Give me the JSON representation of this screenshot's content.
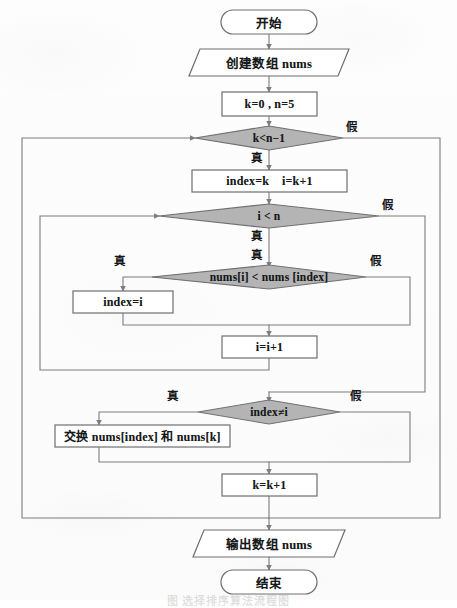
{
  "diagram": {
    "title": "选择排序算法流程图",
    "caption": "图   选择排序算法流程图",
    "colors": {
      "line": "#7c7c80",
      "decision_fill": "#b4b4b4",
      "decision_stroke": "#707074",
      "shape_stroke": "#6e6e72",
      "shape_fill": "#ffffff",
      "text": "#16181a",
      "page_background": "#fdfdfd"
    },
    "nodes": [
      {
        "id": "start",
        "type": "terminator",
        "label": "开始"
      },
      {
        "id": "create",
        "type": "io",
        "label": "创建数组 nums"
      },
      {
        "id": "init",
        "type": "process",
        "label": "k=0 , n=5"
      },
      {
        "id": "cond_k",
        "type": "decision",
        "label": "k<n−1"
      },
      {
        "id": "assign",
        "type": "process",
        "label": "index=k    i=k+1"
      },
      {
        "id": "cond_i",
        "type": "decision",
        "label": "i < n"
      },
      {
        "id": "cmp",
        "type": "decision",
        "label": "nums[i] < nums [index]"
      },
      {
        "id": "setidx",
        "type": "process",
        "label": "index=i"
      },
      {
        "id": "incr_i",
        "type": "process",
        "label": "i=i+1"
      },
      {
        "id": "cond_ne",
        "type": "decision",
        "label": "index≠i"
      },
      {
        "id": "swap",
        "type": "process",
        "label": "交换 nums[index] 和 nums[k]"
      },
      {
        "id": "incr_k",
        "type": "process",
        "label": "k=k+1"
      },
      {
        "id": "output",
        "type": "io",
        "label": "输出数组 nums"
      },
      {
        "id": "end",
        "type": "terminator",
        "label": "结束"
      }
    ],
    "branch_labels": {
      "cond_k_true": "真",
      "cond_k_false": "假",
      "cond_i_true": "真",
      "cond_i_false": "假",
      "cmp_true": "真",
      "cmp_false": "假",
      "cmp_center": "真",
      "cond_ne_true": "真",
      "cond_ne_false": "假"
    }
  }
}
